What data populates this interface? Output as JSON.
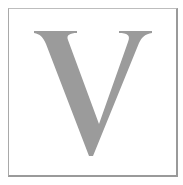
{
  "caption": {
    "text": "        "
  },
  "tile": {
    "letter": "V",
    "letter_color": "#9b9b9b",
    "frame_color": "#9a9a9a",
    "background": "#ffffff"
  }
}
